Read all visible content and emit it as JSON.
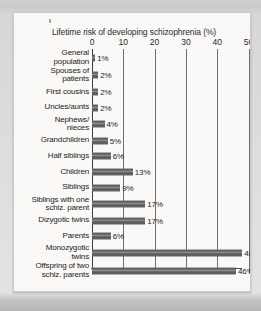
{
  "chart_data": {
    "type": "bar",
    "orientation": "horizontal",
    "title": "Lifetime risk of  developing schizophrenia (%)",
    "xlabel": "",
    "ylabel": "",
    "xlim": [
      0,
      50
    ],
    "xticks": [
      0,
      10,
      20,
      30,
      40,
      50
    ],
    "xtick_labels": [
      "0",
      "10",
      "20",
      "30",
      "40",
      "50"
    ],
    "grid": true,
    "legend": false,
    "value_suffix": "%",
    "categories": [
      "General population",
      "Spouses of patients",
      "First cousins",
      "Uncles/aunts",
      "Nephews/ nieces",
      "Grandchildren",
      "Half siblings",
      "Children",
      "Siblings",
      "Siblings with one schiz. parent",
      "Dizygotic twins",
      "Parents",
      "Monozygotic twins",
      "Offspring of two schiz. parents"
    ],
    "values": [
      1,
      2,
      2,
      2,
      4,
      5,
      6,
      13,
      9,
      17,
      17,
      6,
      48,
      46
    ],
    "value_labels": [
      "1%",
      "2%",
      "2%",
      "2%",
      "4%",
      "5%",
      "6%",
      "13%",
      "9%",
      "17%",
      "17%",
      "6%",
      "48%",
      "46%"
    ]
  },
  "rows": [
    {
      "label_lines": [
        "General",
        "population"
      ],
      "value": 1,
      "value_label": "1%"
    },
    {
      "label_lines": [
        "Spouses of",
        "patients"
      ],
      "value": 2,
      "value_label": "2%"
    },
    {
      "label_lines": [
        "First cousins"
      ],
      "value": 2,
      "value_label": "2%"
    },
    {
      "label_lines": [
        "Uncles/aunts"
      ],
      "value": 2,
      "value_label": "2%"
    },
    {
      "label_lines": [
        "Nephews/",
        "nieces"
      ],
      "value": 4,
      "value_label": "4%"
    },
    {
      "label_lines": [
        "Grandchildren"
      ],
      "value": 5,
      "value_label": "5%"
    },
    {
      "label_lines": [
        "Half siblings"
      ],
      "value": 6,
      "value_label": "6%"
    },
    {
      "label_lines": [
        "Children"
      ],
      "value": 13,
      "value_label": "13%"
    },
    {
      "label_lines": [
        "Siblings"
      ],
      "value": 9,
      "value_label": "9%"
    },
    {
      "label_lines": [
        "Siblings with one",
        "schiz. parent"
      ],
      "value": 17,
      "value_label": "17%"
    },
    {
      "label_lines": [
        "Dizygotic twins"
      ],
      "value": 17,
      "value_label": "17%"
    },
    {
      "label_lines": [
        "Parents"
      ],
      "value": 6,
      "value_label": "6%"
    },
    {
      "label_lines": [
        "Monozygotic",
        "twins"
      ],
      "value": 48,
      "value_label": "48%"
    },
    {
      "label_lines": [
        "Offspring of two",
        "schiz. parents"
      ],
      "value": 46,
      "value_label": "46%"
    }
  ],
  "colors": {
    "bar": "#5f5f5f",
    "axis": "#3d3d3d",
    "grid": "#6f6f6f",
    "text": "#232323",
    "card": "#fbfaf8",
    "page": "#c9c9c9"
  }
}
